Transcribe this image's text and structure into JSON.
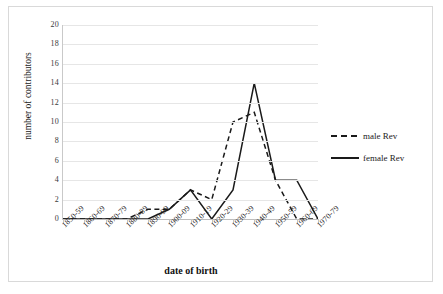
{
  "chart_data": {
    "type": "line",
    "title": "",
    "xlabel": "date of birth",
    "ylabel": "number of contributors",
    "categories": [
      "1850-59",
      "1860-69",
      "1870-79",
      "1880-89",
      "1890-99",
      "1900-09",
      "1910-19",
      "1920-29",
      "1930-39",
      "1940-49",
      "1950-59",
      "1960-69",
      "1970-79"
    ],
    "series": [
      {
        "name": "male Rev",
        "style": "dashed",
        "color": "#1a1a1a",
        "values": [
          0,
          0,
          0,
          0,
          1,
          1,
          3,
          2,
          10,
          11,
          4,
          0,
          0
        ]
      },
      {
        "name": "female Rev",
        "style": "solid",
        "color": "#1a1a1a",
        "values": [
          0,
          0,
          0,
          0,
          0,
          1,
          3,
          0,
          3,
          14,
          4,
          4,
          0
        ]
      }
    ],
    "ylim": [
      0,
      20
    ],
    "ytick_step": 2,
    "yticks": [
      "0",
      "2",
      "4",
      "6",
      "8",
      "10",
      "12",
      "14",
      "16",
      "18",
      "20"
    ],
    "grid": true,
    "legend_position": "right"
  },
  "legend": {
    "items": [
      {
        "label": "male Rev",
        "style": "dashed"
      },
      {
        "label": "female Rev",
        "style": "solid"
      }
    ]
  },
  "axes": {
    "y_title": "number of contributors",
    "x_title": "date of birth"
  }
}
